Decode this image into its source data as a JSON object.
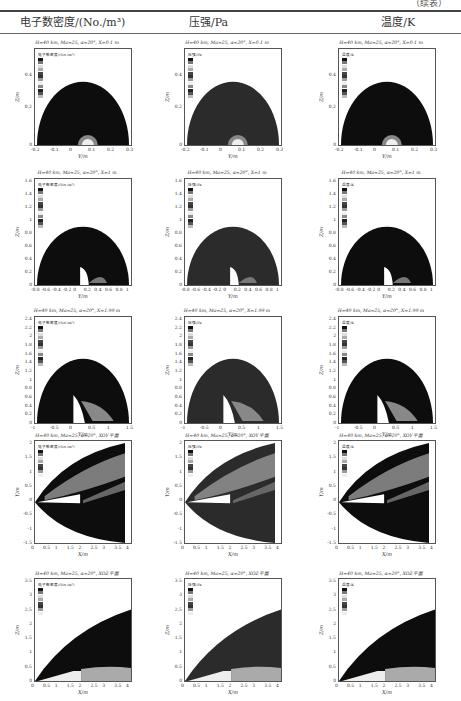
{
  "page": {
    "continuation_label": "（续表）",
    "columns": [
      "电子数密度/(No./m³)",
      "压强/Pa",
      "温度/K"
    ]
  },
  "rows": [
    {
      "condition": "H=40 km, Ma=25, α=20°, X=0.1 m",
      "xlabel": "Y/m",
      "ylabel": "Z/m",
      "xticks": [
        "-0.2",
        "-0.1",
        "0",
        "0.1",
        "0.2",
        "0.3"
      ],
      "yticks": [
        "0.4",
        "0.2",
        "0"
      ]
    },
    {
      "condition": "H=40 km, Ma=25, α=20°, X=1 m",
      "xlabel": "Y/m",
      "ylabel": "Z/m",
      "xticks": [
        "-0.8",
        "-0.6",
        "-0.4",
        "-0.2",
        "0",
        "0.2",
        "0.4",
        "0.6",
        "0.8",
        "1"
      ],
      "yticks": [
        "1.6",
        "1.4",
        "1.2",
        "1",
        "0.8",
        "0.6",
        "0.4",
        "0.2",
        "0"
      ]
    },
    {
      "condition": "H=40 km, Ma=25, α=20°, X=1.99 m",
      "xlabel": "Y/m",
      "ylabel": "Z/m",
      "xticks": [
        "-1",
        "-0.5",
        "0",
        "0.5",
        "1",
        "1.5"
      ],
      "yticks": [
        "2.4",
        "2.2",
        "2",
        "1.8",
        "1.6",
        "1.4",
        "1.2",
        "1",
        "0.8",
        "0.6",
        "0.4",
        "0.2",
        "0"
      ]
    },
    {
      "condition": "H=40 km, Ma=25, α=20°, XOY平面",
      "xlabel": "X/m",
      "ylabel": "Y/m",
      "xticks": [
        "0",
        "0.5",
        "1",
        "1.5",
        "2",
        "2.5",
        "3",
        "3.5",
        "4"
      ],
      "yticks": [
        "2",
        "1.5",
        "1",
        "0.5",
        "0",
        "-0.5",
        "-1",
        "-1.5"
      ]
    },
    {
      "condition": "H=40 km, Ma=25, α=20°, XOZ平面",
      "xlabel": "X/m",
      "ylabel": "Z/m",
      "xticks": [
        "0",
        "0.5",
        "1",
        "1.5",
        "2",
        "2.5",
        "3",
        "3.5",
        "4"
      ],
      "yticks": [
        "3.5",
        "3",
        "2.5",
        "2",
        "1.5",
        "1",
        "0.5",
        "0"
      ]
    }
  ],
  "legends": {
    "density": "电子数密度/(No./m³)",
    "pressure": "压强/Pa",
    "temperature": "温度/K"
  }
}
